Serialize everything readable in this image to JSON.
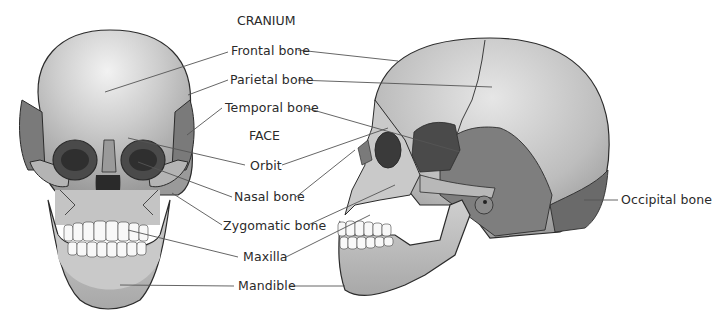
{
  "figure": {
    "type": "anatomical-diagram",
    "views": [
      "anterior",
      "lateral"
    ]
  },
  "sections": {
    "cranium_header": "CRANIUM",
    "face_header": "FACE"
  },
  "labels": {
    "frontal_bone": "Frontal bone",
    "parietal_bone": "Parietal bone",
    "temporal_bone": "Temporal bone",
    "orbit": "Orbit",
    "nasal_bone": "Nasal bone",
    "zygomatic_bone": "Zygomatic bone",
    "maxilla": "Maxilla",
    "mandible": "Mandible",
    "occipital_bone": "Occipital bone"
  },
  "colors": {
    "bone_light": "#cfcfcf",
    "bone_mid": "#a9a9a9",
    "bone_dark": "#6e6e6e",
    "bone_darkest": "#3e3e3e",
    "outline": "#2b2b2b",
    "leader_line": "#555555",
    "text": "#2a2a2a"
  }
}
